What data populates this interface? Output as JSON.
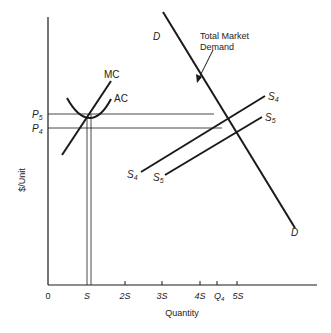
{
  "diagram": {
    "title": "",
    "y_axis_label": "$/Unit",
    "x_axis_label": "Quantity",
    "x_ticks": [
      {
        "label": "0",
        "x": 48
      },
      {
        "label": "S",
        "x": 87
      },
      {
        "label": "2S",
        "x": 125
      },
      {
        "label": "3S",
        "x": 162
      },
      {
        "label": "4S",
        "x": 200
      },
      {
        "label": "Q",
        "sub": "4",
        "x": 217
      },
      {
        "label": "5S",
        "x": 237
      }
    ],
    "y_ticks": [
      {
        "label": "P",
        "sub": "5"
      },
      {
        "label": "P",
        "sub": "4"
      }
    ],
    "curves": {
      "mc": "MC",
      "ac": "AC",
      "demand_top": "D",
      "demand_bottom": "D",
      "s4_left": "S",
      "s4_left_sub": "4",
      "s4_right": "S",
      "s4_right_sub": "4",
      "s5_left": "S",
      "s5_left_sub": "5",
      "s5_right": "S",
      "s5_right_sub": "5"
    },
    "annotation": {
      "line1": "Total Market",
      "line2": "Demand"
    },
    "colors": {
      "ink": "#1a1a1a",
      "background": "#ffffff"
    }
  }
}
